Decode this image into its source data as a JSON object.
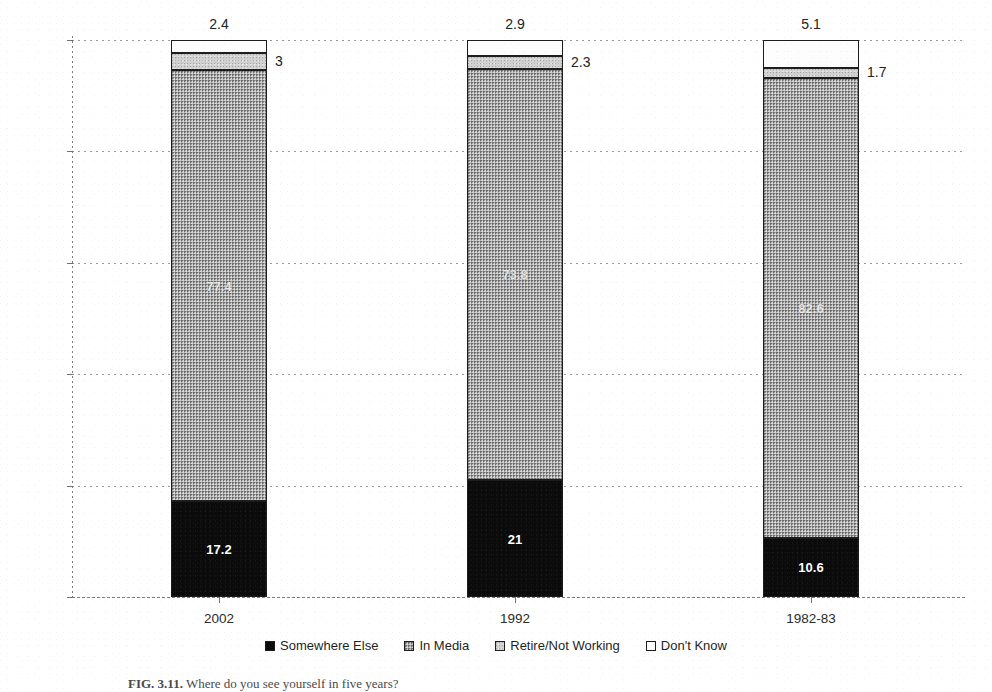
{
  "chart_data": {
    "type": "bar",
    "subtype": "stacked-100-percent",
    "title": "",
    "xlabel": "",
    "ylabel": "",
    "categories": [
      "2002",
      "1992",
      "1982-83"
    ],
    "ylim": [
      0,
      100
    ],
    "ytick_labels": [
      "0%",
      "20%",
      "40%",
      "60%",
      "80%",
      "100%"
    ],
    "ytick_values": [
      0,
      20,
      40,
      60,
      80,
      100
    ],
    "grid": true,
    "legend_position": "bottom",
    "series": [
      {
        "name": "Somewhere Else",
        "color": "#0b0b0b",
        "values": [
          17.2,
          21,
          10.6
        ],
        "labels": [
          "17.2",
          "21",
          "10.6"
        ]
      },
      {
        "name": "In Media",
        "color": "#a9a9a9",
        "values": [
          77.4,
          73.8,
          82.6
        ],
        "labels": [
          "77.4",
          "73.8",
          "82.6"
        ]
      },
      {
        "name": "Retire/Not Working",
        "color": "#d2d2d2",
        "values": [
          3,
          2.3,
          1.7
        ],
        "labels": [
          "3",
          "2.3",
          "1.7"
        ]
      },
      {
        "name": "Don't Know",
        "color": "#ffffff",
        "values": [
          2.4,
          2.9,
          5.1
        ],
        "labels": [
          "2.4",
          "2.9",
          "5.1"
        ]
      }
    ]
  },
  "axis": {
    "y_ticks": [
      {
        "label": "100%",
        "value": 100
      },
      {
        "label": "80%",
        "value": 80
      },
      {
        "label": "60%",
        "value": 60
      },
      {
        "label": "40%",
        "value": 40
      },
      {
        "label": "20%",
        "value": 20
      },
      {
        "label": "0%",
        "value": 0
      }
    ],
    "x_ticks": [
      {
        "label": "2002"
      },
      {
        "label": "1992"
      },
      {
        "label": "1982-83"
      }
    ]
  },
  "legend": {
    "items": [
      {
        "label": "Somewhere Else",
        "swatch": "black-filled-swatch"
      },
      {
        "label": "In Media",
        "swatch": "gray-filled-swatch"
      },
      {
        "label": "Retire/Not Working",
        "swatch": "white-outlined-swatch"
      },
      {
        "label": "Don't Know",
        "swatch": "white-outlined-swatch"
      }
    ]
  },
  "caption": {
    "figure_number": "FIG. 3.11.",
    "text": "Where do you see yourself in five years?"
  },
  "bars": [
    {
      "category": "2002",
      "top_callout": "2.4",
      "side_callout": "3",
      "inner_media": "77.4",
      "inner_bottom": "17.2"
    },
    {
      "category": "1992",
      "top_callout": "2.9",
      "side_callout": "2.3",
      "inner_media": "73.8",
      "inner_bottom": "21"
    },
    {
      "category": "1982-83",
      "top_callout": "5.1",
      "side_callout": "1.7",
      "inner_media": "82.6",
      "inner_bottom": "10.6"
    }
  ]
}
